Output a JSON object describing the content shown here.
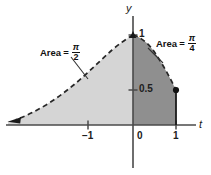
{
  "figure": {
    "background_color": "#ffffff"
  },
  "axes": {
    "x_axis_label": "t",
    "y_axis_label": "y",
    "x_ticks": [
      {
        "value": -1,
        "label": "−1"
      },
      {
        "value": 0,
        "label": "0"
      },
      {
        "value": 1,
        "label": "1"
      }
    ],
    "y_ticks": [
      {
        "value": 0.5,
        "label": "0.5"
      },
      {
        "value": 1,
        "label": "1"
      }
    ],
    "axis_color": "#4a4a4a",
    "x_range": [
      -2.95,
      1.72
    ],
    "y_range": [
      -0.42,
      1.28
    ],
    "grid": false
  },
  "regions": [
    {
      "name": "left-region",
      "label_text": "Area",
      "equals": "=",
      "numerator": "π",
      "denominator": "2",
      "fill_color": "#d4d4d4",
      "t_from": "-∞",
      "t_to": 0,
      "area_value": "π/2"
    },
    {
      "name": "right-region",
      "label_text": "Area",
      "equals": "=",
      "numerator": "π",
      "denominator": "4",
      "fill_color": "#8f8f8f",
      "t_from": 0,
      "t_to": 1,
      "area_value": "π/4"
    }
  ],
  "curve": {
    "name": "arctan-derivative-curve",
    "equation": "y = 1/(1+t^2)",
    "style_left": "dashed",
    "style_right": "dashed",
    "color": "#262626",
    "arrow_left": true,
    "points_marked": [
      {
        "t": 0,
        "y": 1
      },
      {
        "t": 1,
        "y": 0.5
      }
    ]
  },
  "markers": {
    "endpoint_dot": {
      "t": 1,
      "y": 0.5,
      "filled": true,
      "color": "#111111"
    },
    "peak_tick": {
      "t": 0,
      "y": 1
    }
  }
}
